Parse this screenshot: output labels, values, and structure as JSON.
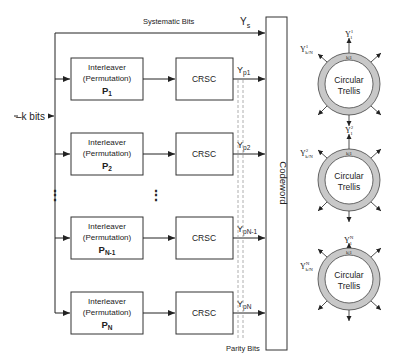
{
  "diagram": {
    "input_label": "k bits",
    "systematic_label": "Systematic Bits",
    "systematic_output": {
      "base": "Y",
      "sub": "s"
    },
    "parity_label": "Parity Bits",
    "codeword_label": "Codeword",
    "branches": [
      {
        "interleaver_line1": "Interleaver",
        "interleaver_line2": "(Permutation)",
        "perm_base": "P",
        "perm_sub": "1",
        "encoder": "CRSC",
        "out_base": "Y",
        "out_sub": "p1"
      },
      {
        "interleaver_line1": "Interleaver",
        "interleaver_line2": "(Permutation)",
        "perm_base": "P",
        "perm_sub": "2",
        "encoder": "CRSC",
        "out_base": "Y",
        "out_sub": "p2"
      },
      {
        "interleaver_line1": "Interleaver",
        "interleaver_line2": "(Permutation)",
        "perm_base": "P",
        "perm_sub": "N-1",
        "encoder": "CRSC",
        "out_base": "Y",
        "out_sub": "pN-1"
      },
      {
        "interleaver_line1": "Interleaver",
        "interleaver_line2": "(Permutation)",
        "perm_base": "P",
        "perm_sub": "N",
        "encoder": "CRSC",
        "out_base": "Y",
        "out_sub": "pN"
      }
    ],
    "ellipsis": "⋮",
    "trellises": [
      {
        "label_line1": "Circular",
        "label_line2": "Trellis",
        "top_base": "Y",
        "top_sup": "1",
        "top_sub": "1",
        "side_base": "Y",
        "side_sup": "1",
        "side_sub": "k/N",
        "mark": "k|1"
      },
      {
        "label_line1": "Circular",
        "label_line2": "Trellis",
        "top_base": "Y",
        "top_sup": "2",
        "top_sub": "1",
        "side_base": "Y",
        "side_sup": "2",
        "side_sub": "k/N",
        "mark": "k|1"
      },
      {
        "label_line1": "Circular",
        "label_line2": "Trellis",
        "top_base": "Y",
        "top_sup": "N",
        "top_sub": "1",
        "side_base": "Y",
        "side_sup": "N",
        "side_sub": "k/N",
        "mark": "k|1"
      }
    ],
    "colors": {
      "line": "#222222",
      "ring_fill": "#c8c8c8",
      "dashed": "#999999",
      "box_border": "#333333"
    }
  }
}
